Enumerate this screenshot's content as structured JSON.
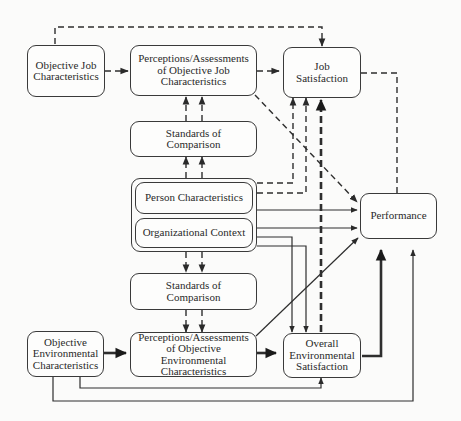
{
  "diagram": {
    "nodes": {
      "objective_job": {
        "label": "Objective Job Characteristics"
      },
      "perc_job": {
        "label": "Perceptions/Assessments of Objective Job Characteristics"
      },
      "job_sat": {
        "label": "Job Satisfaction"
      },
      "standards_top": {
        "label": "Standards of Comparison"
      },
      "person": {
        "label": "Person Characteristics"
      },
      "org": {
        "label": "Organizational Context"
      },
      "performance": {
        "label": "Performance"
      },
      "standards_bottom": {
        "label": "Standards of Comparison"
      },
      "objective_env": {
        "label": "Objective Environmental Characteristics"
      },
      "perc_env": {
        "label": "Perceptions/Assessments of Objective Environmental Characteristics"
      },
      "overall_env": {
        "label": "Overall Environmental Satisfaction"
      }
    },
    "edge_styles": {
      "dashed": "Job-related causal path",
      "solid": "Environment-related causal path",
      "thick": "Strong / primary path"
    },
    "edges": [
      {
        "from": "Objective Job Characteristics",
        "to": "Perceptions/Assessments of Objective Job Characteristics",
        "style": "dashed"
      },
      {
        "from": "Objective Job Characteristics",
        "to": "Job Satisfaction",
        "style": "dashed"
      },
      {
        "from": "Perceptions/Assessments of Objective Job Characteristics",
        "to": "Job Satisfaction",
        "style": "dashed"
      },
      {
        "from": "Perceptions/Assessments of Objective Job Characteristics",
        "to": "Performance",
        "style": "dashed"
      },
      {
        "from": "Job Satisfaction",
        "to": "Performance",
        "style": "dashed"
      },
      {
        "from": "Standards of Comparison (top)",
        "to": "Perceptions/Assessments of Objective Job Characteristics",
        "style": "dashed"
      },
      {
        "from": "Person Characteristics / Organizational Context",
        "to": "Standards of Comparison (top)",
        "style": "dashed"
      },
      {
        "from": "Person Characteristics",
        "to": "Job Satisfaction",
        "style": "dashed"
      },
      {
        "from": "Organizational Context",
        "to": "Job Satisfaction",
        "style": "dashed"
      },
      {
        "from": "Person Characteristics",
        "to": "Performance",
        "style": "solid"
      },
      {
        "from": "Organizational Context",
        "to": "Performance",
        "style": "solid"
      },
      {
        "from": "Organizational Context",
        "to": "Overall Environmental Satisfaction",
        "style": "solid"
      },
      {
        "from": "Person Characteristics / Organizational Context",
        "to": "Standards of Comparison (bottom)",
        "style": "dashed"
      },
      {
        "from": "Standards of Comparison (bottom)",
        "to": "Perceptions/Assessments of Objective Environmental Characteristics",
        "style": "dashed"
      },
      {
        "from": "Objective Environmental Characteristics",
        "to": "Perceptions/Assessments of Objective Environmental Characteristics",
        "style": "thick"
      },
      {
        "from": "Perceptions/Assessments of Objective Environmental Characteristics",
        "to": "Overall Environmental Satisfaction",
        "style": "thick"
      },
      {
        "from": "Perceptions/Assessments of Objective Environmental Characteristics",
        "to": "Performance",
        "style": "solid"
      },
      {
        "from": "Overall Environmental Satisfaction",
        "to": "Job Satisfaction",
        "style": "thick-dashed"
      },
      {
        "from": "Overall Environmental Satisfaction",
        "to": "Performance",
        "style": "thick"
      },
      {
        "from": "Objective Environmental Characteristics",
        "to": "Overall Environmental Satisfaction",
        "style": "solid"
      },
      {
        "from": "Objective Environmental Characteristics",
        "to": "Performance",
        "style": "solid"
      }
    ]
  }
}
